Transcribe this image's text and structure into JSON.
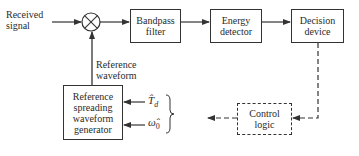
{
  "diagram": {
    "input_label": "Received\nsignal",
    "multiplier": {
      "symbol": "×"
    },
    "reference_label": "Reference\nwaveform",
    "blocks": [
      {
        "id": "bandpass",
        "label": "Bandpass\nfilter"
      },
      {
        "id": "energy",
        "label": "Energy\ndetector"
      },
      {
        "id": "decision",
        "label": "Decision\ndevice"
      },
      {
        "id": "generator",
        "label": "Reference\nspreading\nwaveform\ngenerator"
      },
      {
        "id": "control",
        "label": "Control\nlogic"
      }
    ],
    "estimates": [
      {
        "symbol": "T̂",
        "subscript": "d"
      },
      {
        "symbol": "ω̂",
        "subscript": "0"
      }
    ],
    "line_color": "#333333"
  }
}
